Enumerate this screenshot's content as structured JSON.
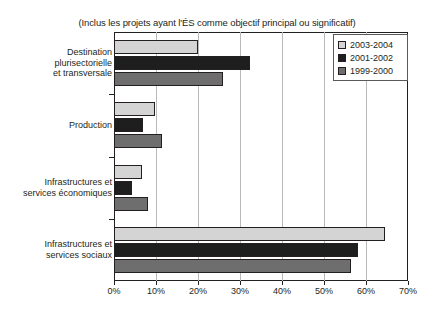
{
  "chart_data": {
    "type": "bar",
    "orientation": "horizontal",
    "title": "(Inclus les projets ayant l'ÉS comme objectif principal ou significatif)",
    "xlabel": "",
    "ylabel": "",
    "xlim": [
      0,
      70
    ],
    "xticks": [
      "0%",
      "10%",
      "20%",
      "30%",
      "40%",
      "50%",
      "60%",
      "70%"
    ],
    "xtick_values": [
      0,
      10,
      20,
      30,
      40,
      50,
      60,
      70
    ],
    "grid": true,
    "legend_position": "top-right",
    "categories": [
      "Destination plurisectorielle et transversale",
      "Production",
      "Infrastructures et services économiques",
      "Infrastructures et services sociaux"
    ],
    "category_lines": [
      [
        "Destination",
        "plurisectorielle",
        "et transversale"
      ],
      [
        "Production"
      ],
      [
        "Infrastructures et",
        "services économiques"
      ],
      [
        "Infrastructures et",
        "services sociaux"
      ]
    ],
    "series": [
      {
        "name": "2003-2004",
        "color": "#d4d4d4",
        "values": [
          20.0,
          9.7,
          6.7,
          64.5
        ]
      },
      {
        "name": "2001-2002",
        "color": "#1e1e1e",
        "values": [
          32.3,
          7.0,
          4.3,
          58.0
        ]
      },
      {
        "name": "1999-2000",
        "color": "#6e6e6e",
        "values": [
          26.0,
          11.5,
          8.0,
          56.5
        ]
      }
    ]
  },
  "legend": {
    "items": [
      {
        "label": "2003-2004",
        "color": "#d4d4d4"
      },
      {
        "label": "2001-2002",
        "color": "#1e1e1e"
      },
      {
        "label": "1999-2000",
        "color": "#6e6e6e"
      }
    ]
  }
}
